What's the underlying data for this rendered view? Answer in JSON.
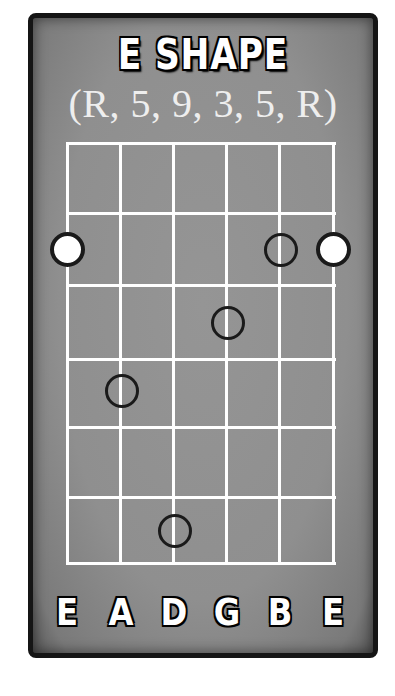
{
  "diagram": {
    "title": "E SHAPE",
    "intervals_label": "(R, 5, 9, 3, 5, R)",
    "colors": {
      "card_background": "#8f8f8f",
      "card_border": "#151515",
      "grid_lines": "#ffffff",
      "root_fill": "#ffffff",
      "dot_outline": "#1a1a1a"
    },
    "grid": {
      "strings": 6,
      "fret_rows": 6
    },
    "strings": [
      {
        "label": "E",
        "interval": "R"
      },
      {
        "label": "A",
        "interval": "5"
      },
      {
        "label": "D",
        "interval": "9"
      },
      {
        "label": "G",
        "interval": "3"
      },
      {
        "label": "B",
        "interval": "5"
      },
      {
        "label": "E",
        "interval": "R"
      }
    ],
    "dots": [
      {
        "string": 1,
        "row": 2,
        "interval": "R",
        "type": "root"
      },
      {
        "string": 2,
        "row": 4,
        "interval": "5",
        "type": "hollow"
      },
      {
        "string": 3,
        "row": 6,
        "interval": "9",
        "type": "hollow"
      },
      {
        "string": 4,
        "row": 3,
        "interval": "3",
        "type": "hollow"
      },
      {
        "string": 5,
        "row": 2,
        "interval": "5",
        "type": "hollow"
      },
      {
        "string": 6,
        "row": 2,
        "interval": "R",
        "type": "root"
      }
    ]
  }
}
